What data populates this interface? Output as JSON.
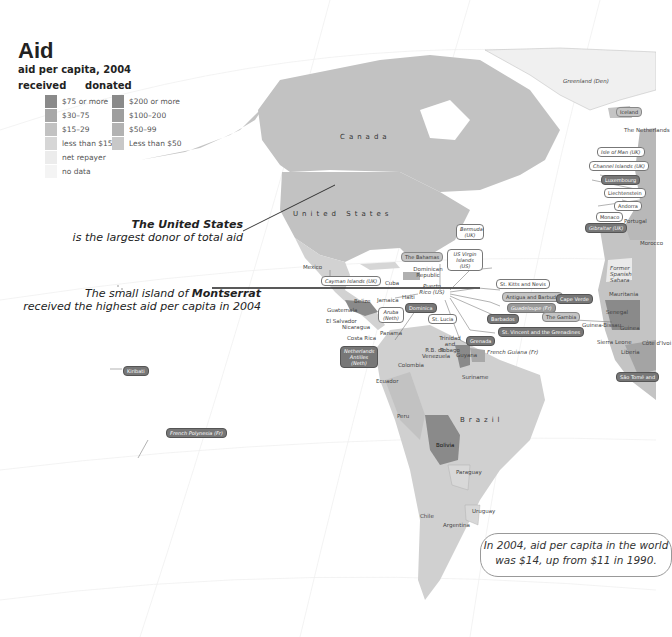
{
  "title": "Aid",
  "subtitle": "aid per capita, 2004",
  "legend": {
    "received": {
      "heading": "received",
      "items": [
        {
          "label": "$75 or more",
          "color": "#8a8a8a"
        },
        {
          "label": "$30–75",
          "color": "#a8a8a8"
        },
        {
          "label": "$15–29",
          "color": "#c2c2c2"
        },
        {
          "label": "less than $15",
          "color": "#d6d6d6"
        },
        {
          "label": "net repayer",
          "color": "#ececec"
        },
        {
          "label": "no data",
          "color": "#f4f4f4"
        }
      ]
    },
    "donated": {
      "heading": "donated",
      "items": [
        {
          "label": "$200 or more",
          "color": "#8a8a8a"
        },
        {
          "label": "$100–200",
          "color": "#9e9e9e"
        },
        {
          "label": "$50–99",
          "color": "#b2b2b2"
        },
        {
          "label": "Less than $50",
          "color": "#c8c8c8"
        }
      ]
    }
  },
  "annotations": {
    "us_bold": "The United States",
    "us_text": "is the largest donor of total aid",
    "montserrat_pre": "The small island of ",
    "montserrat_bold": "Montserrat",
    "montserrat_text": "received the highest aid per capita in 2004",
    "callout_line1": "In 2004, aid per capita in the world",
    "callout_line2": "was $14, up from $11 in 1990."
  },
  "regions": {
    "canada": "Canada",
    "united_states": "United States",
    "brazil": "Brazil",
    "greenland": "Greenland (Den)",
    "iceland": "Iceland",
    "netherlands": "The Netherlands",
    "mexico": "Mexico",
    "cuba": "Cuba",
    "belize": "Belize",
    "jamaica": "Jamaica",
    "haiti": "Haiti",
    "dominican_republic": "Dominican Republic",
    "puerto_rico": "Puerto Rico (US)",
    "guatemala": "Guatemala",
    "honduras": "Honduras",
    "el_salvador": "El Salvador",
    "nicaragua": "Nicaragua",
    "costa_rica": "Costa Rica",
    "panama": "Panama",
    "colombia": "Colombia",
    "venezuela": "R.B. de Venezuela",
    "trinidad": "Trinidad and Tobago",
    "guyana": "Guyana",
    "suriname": "Suriname",
    "french_guiana": "French Guiana (Fr)",
    "ecuador": "Ecuador",
    "peru": "Peru",
    "bolivia": "Bolivia",
    "paraguay": "Paraguay",
    "uruguay": "Uruguay",
    "chile": "Chile",
    "argentina": "Argentina",
    "morocco": "Morocco",
    "western_sahara": "Former Spanish Sahara",
    "mauritania": "Mauritania",
    "senegal": "Senegal",
    "guinea_bissau": "Guinea-Bissau",
    "guinea": "Guinea",
    "sierra_leone": "Sierra Leone",
    "liberia": "Liberia",
    "cote_divoire": "Côte d'Ivoi",
    "portugal": "Portugal"
  },
  "boxed_labels": {
    "bermuda": "Bermuda (UK)",
    "bahamas": "The Bahamas",
    "us_virgin": "US Virgin Islands (US)",
    "cayman": "Cayman Islands (UK)",
    "st_kitts": "St. Kitts and Nevis",
    "antigua": "Antigua and Barbuda",
    "guadeloupe": "Guadeloupe (Fr)",
    "barbados": "Barbados",
    "st_vincent": "St. Vincent and the Grenadines",
    "grenada": "Grenada",
    "st_lucia": "St. Lucia",
    "aruba": "Aruba (Neth)",
    "dominica": "Dominica",
    "neth_antilles": "Netherlands Antilles (Neth)",
    "cape_verde": "Cape Verde",
    "gambia": "The Gambia",
    "sao_tome": "São Tomé and",
    "kiribati": "Kiribati",
    "french_polynesia": "French Polynesia (Fr)",
    "isle_of_man": "Isle of Man (UK)",
    "channel_islands": "Channel Islands (UK)",
    "luxembourg": "Luxembourg",
    "liechtenstein": "Liechtenstein",
    "andorra": "Andorra",
    "monaco": "Monaco",
    "gibraltar": "Gibraltar (UK)"
  }
}
